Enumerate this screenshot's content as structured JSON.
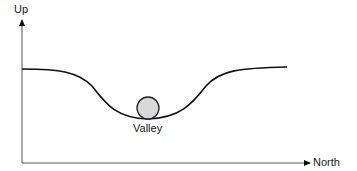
{
  "diagram": {
    "y_axis_label": "Up",
    "x_axis_label": "North",
    "ball_label": "Valley",
    "colors": {
      "axis": "#555555",
      "curve": "#111111",
      "ball_fill": "#d9d9d9",
      "ball_stroke": "#222222"
    }
  }
}
